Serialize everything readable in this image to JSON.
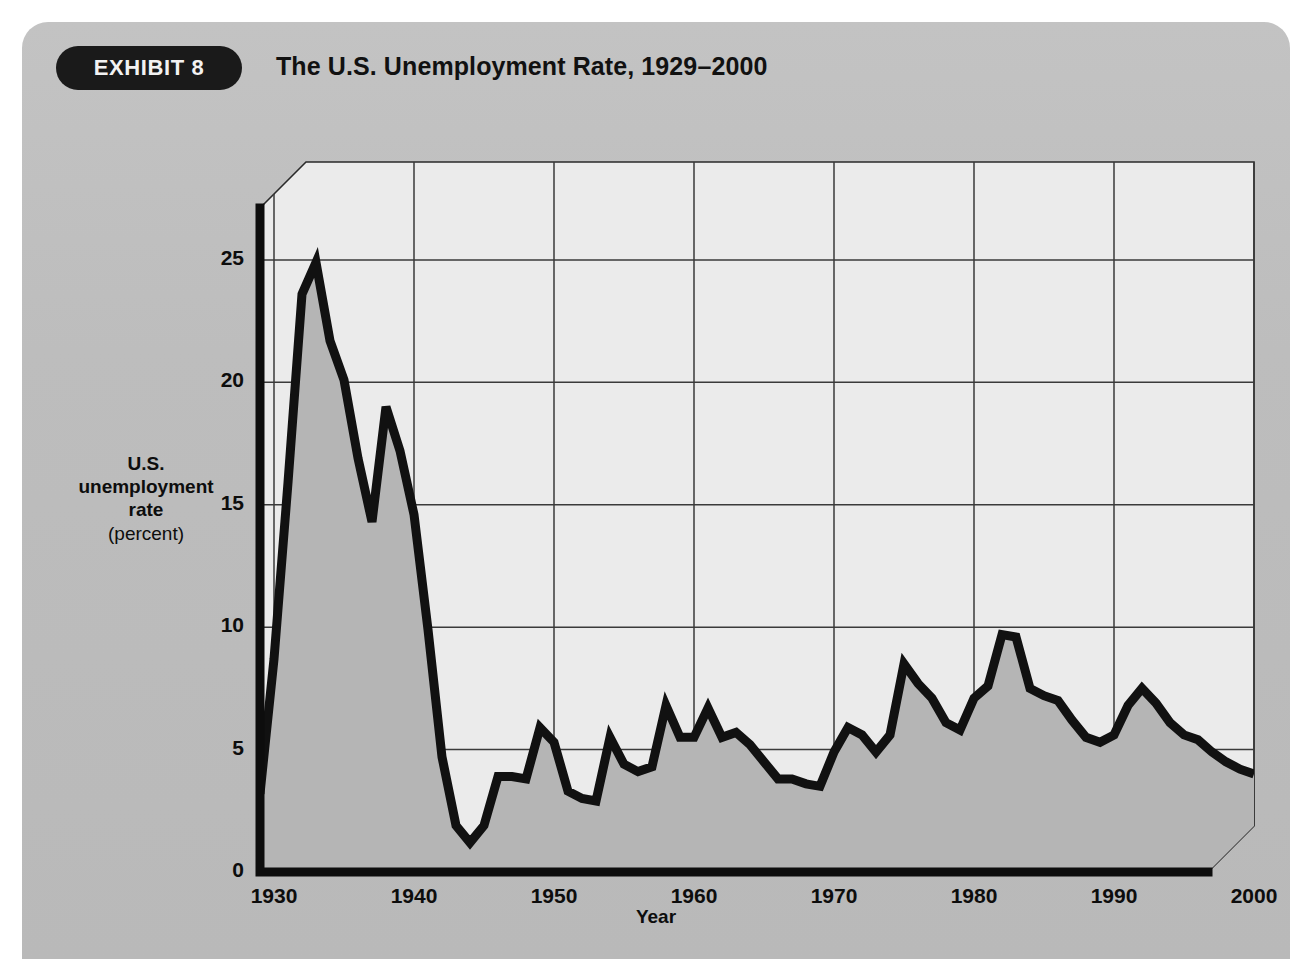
{
  "exhibit": {
    "badge_label": "EXHIBIT 8",
    "title": "The U.S. Unemployment Rate, 1929–2000"
  },
  "colors": {
    "card_background": "#bdbdbd",
    "badge_background": "#1a1a1a",
    "badge_text": "#f2f2f2",
    "plot_background": "#ebebeb",
    "area_fill": "#b5b5b5",
    "line": "#111111",
    "gridline": "#3a3a3a",
    "axis": "#0d0d0d",
    "text": "#0d0d0d"
  },
  "chart_data": {
    "type": "area",
    "title": "The U.S. Unemployment Rate, 1929–2000",
    "subtitle": "",
    "xlabel": "Year",
    "ylabel": "U.S. unemployment rate (percent)",
    "ylabel_lines": [
      "U.S.",
      "unemployment",
      "rate"
    ],
    "ylabel_unit": "(percent)",
    "xlim": [
      1929,
      2000
    ],
    "ylim": [
      0,
      29
    ],
    "grid": true,
    "legend": false,
    "legend_position": "none",
    "y_ticks": [
      0,
      5,
      10,
      15,
      20,
      25
    ],
    "y_tick_labels": [
      "0",
      "5",
      "10",
      "15",
      "20",
      "25"
    ],
    "x_ticks": [
      1930,
      1940,
      1950,
      1960,
      1970,
      1980,
      1990,
      2000
    ],
    "x_tick_labels": [
      "1930",
      "1940",
      "1950",
      "1960",
      "1970",
      "1980",
      "1990",
      "2000"
    ],
    "series_name": "U.S. unemployment rate (percent)",
    "x": [
      1929,
      1930,
      1931,
      1932,
      1933,
      1934,
      1935,
      1936,
      1937,
      1938,
      1939,
      1940,
      1941,
      1942,
      1943,
      1944,
      1945,
      1946,
      1947,
      1948,
      1949,
      1950,
      1951,
      1952,
      1953,
      1954,
      1955,
      1956,
      1957,
      1958,
      1959,
      1960,
      1961,
      1962,
      1963,
      1964,
      1965,
      1966,
      1967,
      1968,
      1969,
      1970,
      1971,
      1972,
      1973,
      1974,
      1975,
      1976,
      1977,
      1978,
      1979,
      1980,
      1981,
      1982,
      1983,
      1984,
      1985,
      1986,
      1987,
      1988,
      1989,
      1990,
      1991,
      1992,
      1993,
      1994,
      1995,
      1996,
      1997,
      1998,
      1999,
      2000
    ],
    "values": [
      3.2,
      8.7,
      15.9,
      23.6,
      24.9,
      21.7,
      20.1,
      16.9,
      14.3,
      19.0,
      17.2,
      14.6,
      9.9,
      4.7,
      1.9,
      1.2,
      1.9,
      3.9,
      3.9,
      3.8,
      5.9,
      5.3,
      3.3,
      3.0,
      2.9,
      5.5,
      4.4,
      4.1,
      4.3,
      6.8,
      5.5,
      5.5,
      6.7,
      5.5,
      5.7,
      5.2,
      4.5,
      3.8,
      3.8,
      3.6,
      3.5,
      4.9,
      5.9,
      5.6,
      4.9,
      5.6,
      8.5,
      7.7,
      7.1,
      6.1,
      5.8,
      7.1,
      7.6,
      9.7,
      9.6,
      7.5,
      7.2,
      7.0,
      6.2,
      5.5,
      5.3,
      5.6,
      6.8,
      7.5,
      6.9,
      6.1,
      5.6,
      5.4,
      4.9,
      4.5,
      4.2,
      4.0
    ],
    "annotations": []
  }
}
